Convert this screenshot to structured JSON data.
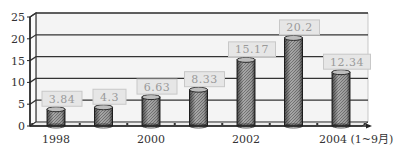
{
  "chart_data": {
    "type": "bar",
    "title": "",
    "xlabel": "",
    "ylabel": "",
    "ylim": [
      0,
      25
    ],
    "yticks": [
      0,
      5,
      10,
      15,
      20,
      25
    ],
    "grid": true,
    "legend": null,
    "categories": [
      "1998",
      "1999",
      "2000",
      "2001",
      "2002",
      "2003",
      "2004 (1~9月)"
    ],
    "xtick_labels_shown": [
      "1998",
      "",
      "2000",
      "",
      "2002",
      "",
      "2004 (1~9月)"
    ],
    "values": [
      3.84,
      4.3,
      6.63,
      8.33,
      15.17,
      20.2,
      12.34
    ],
    "value_labels": [
      "3.84",
      "4.3",
      "6.63",
      "8.33",
      "15.17",
      "20.2",
      "12.34"
    ],
    "style": "3d-cylinder"
  },
  "colors": {
    "bar_fill": "#8c8c8c",
    "bar_edge": "#2a2a2a",
    "label_box": "#e6e6e6",
    "label_text": "#9a9a9a",
    "grid": "#333333",
    "wall": "#f4f4f4"
  }
}
